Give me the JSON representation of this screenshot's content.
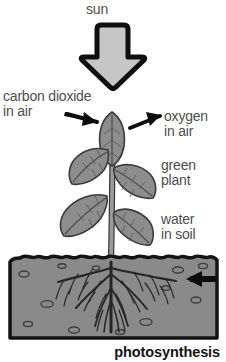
{
  "diagram": {
    "title_caption": "photosynthesis",
    "background_color": "#ffffff",
    "labels": {
      "sun": "sun",
      "carbon_dioxide": "carbon dioxide\nin air",
      "oxygen": "oxygen\nin air",
      "green_plant": "green\nplant",
      "water": "water\nin soil"
    },
    "icons": {
      "sunlight_arrow": "down-arrow-icon",
      "carbon_dioxide_arrow": "right-down-arrow-icon",
      "oxygen_arrow": "right-up-arrow-icon",
      "water_arrow": "left-arrow-icon",
      "plant": "green-plant-icon",
      "soil": "soil-block-icon",
      "roots": "root-system-icon"
    },
    "colors": {
      "label_text": "#4d4d4d",
      "caption_text": "#121212",
      "arrow_fill": "#c3c3c3",
      "arrow_outline": "#111111",
      "leaf_fill": "#8c8c8c",
      "leaf_outline": "#3a3a3a",
      "stem_fill": "#9a9a9a",
      "soil_fill": "#8a8a8a",
      "soil_outline": "#141414",
      "root_color": "#2b2b2b",
      "solid_arrow": "#0d0d0d"
    }
  }
}
